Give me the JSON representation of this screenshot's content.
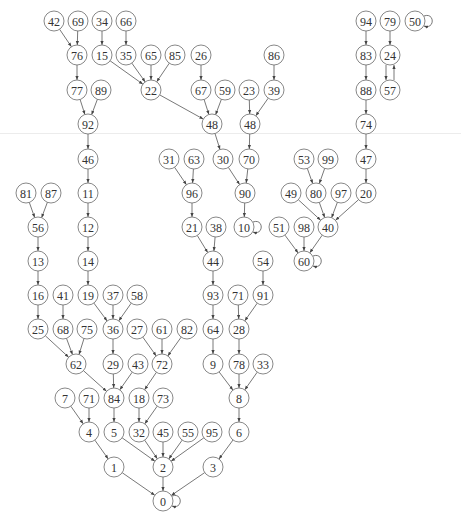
{
  "diagram": {
    "type": "directed-graph",
    "node_radius": 10,
    "colors": {
      "node_stroke": "#6a6a6a",
      "edge": "#555555",
      "label": "#333333",
      "divider": "#ececec"
    },
    "nodes": [
      {
        "id": "n42",
        "label": "42",
        "x": 54,
        "y": 21
      },
      {
        "id": "n69",
        "label": "69",
        "x": 78,
        "y": 21
      },
      {
        "id": "n34",
        "label": "34",
        "x": 102,
        "y": 21
      },
      {
        "id": "n66",
        "label": "66",
        "x": 126,
        "y": 21
      },
      {
        "id": "n94",
        "label": "94",
        "x": 366,
        "y": 21
      },
      {
        "id": "n79",
        "label": "79",
        "x": 390,
        "y": 21
      },
      {
        "id": "n50",
        "label": "50",
        "x": 415,
        "y": 21
      },
      {
        "id": "n76",
        "label": "76",
        "x": 77,
        "y": 55
      },
      {
        "id": "n15",
        "label": "15",
        "x": 102,
        "y": 55
      },
      {
        "id": "n35",
        "label": "35",
        "x": 126,
        "y": 55
      },
      {
        "id": "n65",
        "label": "65",
        "x": 151,
        "y": 55
      },
      {
        "id": "n85",
        "label": "85",
        "x": 175,
        "y": 55
      },
      {
        "id": "n26",
        "label": "26",
        "x": 201,
        "y": 55
      },
      {
        "id": "n86",
        "label": "86",
        "x": 274,
        "y": 55
      },
      {
        "id": "n83",
        "label": "83",
        "x": 366,
        "y": 55
      },
      {
        "id": "n24",
        "label": "24",
        "x": 390,
        "y": 55
      },
      {
        "id": "n77",
        "label": "77",
        "x": 77,
        "y": 90
      },
      {
        "id": "n89",
        "label": "89",
        "x": 101,
        "y": 90
      },
      {
        "id": "n22",
        "label": "22",
        "x": 151,
        "y": 90
      },
      {
        "id": "n67",
        "label": "67",
        "x": 201,
        "y": 90
      },
      {
        "id": "n59",
        "label": "59",
        "x": 225,
        "y": 90
      },
      {
        "id": "n23",
        "label": "23",
        "x": 249,
        "y": 90
      },
      {
        "id": "n39",
        "label": "39",
        "x": 274,
        "y": 90
      },
      {
        "id": "n88",
        "label": "88",
        "x": 366,
        "y": 90
      },
      {
        "id": "n57",
        "label": "57",
        "x": 390,
        "y": 90
      },
      {
        "id": "n92",
        "label": "92",
        "x": 88,
        "y": 124
      },
      {
        "id": "n48a",
        "label": "48",
        "x": 212,
        "y": 124
      },
      {
        "id": "n48b",
        "label": "48",
        "x": 250,
        "y": 124
      },
      {
        "id": "n74",
        "label": "74",
        "x": 366,
        "y": 124
      },
      {
        "id": "n46",
        "label": "46",
        "x": 88,
        "y": 159
      },
      {
        "id": "n31",
        "label": "31",
        "x": 169,
        "y": 159
      },
      {
        "id": "n63",
        "label": "63",
        "x": 194,
        "y": 159
      },
      {
        "id": "n30",
        "label": "30",
        "x": 223,
        "y": 159
      },
      {
        "id": "n70",
        "label": "70",
        "x": 249,
        "y": 159
      },
      {
        "id": "n53",
        "label": "53",
        "x": 304,
        "y": 159
      },
      {
        "id": "n99",
        "label": "99",
        "x": 328,
        "y": 159
      },
      {
        "id": "n47",
        "label": "47",
        "x": 366,
        "y": 159
      },
      {
        "id": "n81",
        "label": "81",
        "x": 26,
        "y": 193
      },
      {
        "id": "n87",
        "label": "87",
        "x": 51,
        "y": 193
      },
      {
        "id": "n11",
        "label": "11",
        "x": 88,
        "y": 193
      },
      {
        "id": "n96",
        "label": "96",
        "x": 192,
        "y": 193
      },
      {
        "id": "n90",
        "label": "90",
        "x": 245,
        "y": 193
      },
      {
        "id": "n49",
        "label": "49",
        "x": 291,
        "y": 193
      },
      {
        "id": "n80",
        "label": "80",
        "x": 316,
        "y": 193
      },
      {
        "id": "n97",
        "label": "97",
        "x": 341,
        "y": 193
      },
      {
        "id": "n20",
        "label": "20",
        "x": 366,
        "y": 193
      },
      {
        "id": "n56",
        "label": "56",
        "x": 38,
        "y": 227
      },
      {
        "id": "n12",
        "label": "12",
        "x": 88,
        "y": 227
      },
      {
        "id": "n21",
        "label": "21",
        "x": 192,
        "y": 227
      },
      {
        "id": "n38",
        "label": "38",
        "x": 216,
        "y": 227
      },
      {
        "id": "n10",
        "label": "10",
        "x": 244,
        "y": 227
      },
      {
        "id": "n51",
        "label": "51",
        "x": 279,
        "y": 227
      },
      {
        "id": "n98",
        "label": "98",
        "x": 304,
        "y": 227
      },
      {
        "id": "n40",
        "label": "40",
        "x": 328,
        "y": 227
      },
      {
        "id": "n13",
        "label": "13",
        "x": 38,
        "y": 261
      },
      {
        "id": "n14",
        "label": "14",
        "x": 88,
        "y": 261
      },
      {
        "id": "n44",
        "label": "44",
        "x": 213,
        "y": 261
      },
      {
        "id": "n54",
        "label": "54",
        "x": 263,
        "y": 261
      },
      {
        "id": "n60",
        "label": "60",
        "x": 304,
        "y": 261
      },
      {
        "id": "n16",
        "label": "16",
        "x": 38,
        "y": 295
      },
      {
        "id": "n41",
        "label": "41",
        "x": 63,
        "y": 295
      },
      {
        "id": "n19",
        "label": "19",
        "x": 88,
        "y": 295
      },
      {
        "id": "n37",
        "label": "37",
        "x": 113,
        "y": 295
      },
      {
        "id": "n58",
        "label": "58",
        "x": 137,
        "y": 295
      },
      {
        "id": "n93",
        "label": "93",
        "x": 213,
        "y": 295
      },
      {
        "id": "n71a",
        "label": "71",
        "x": 238,
        "y": 295
      },
      {
        "id": "n91",
        "label": "91",
        "x": 263,
        "y": 295
      },
      {
        "id": "n25",
        "label": "25",
        "x": 38,
        "y": 329
      },
      {
        "id": "n68",
        "label": "68",
        "x": 63,
        "y": 329
      },
      {
        "id": "n75",
        "label": "75",
        "x": 87,
        "y": 329
      },
      {
        "id": "n36",
        "label": "36",
        "x": 113,
        "y": 329
      },
      {
        "id": "n27",
        "label": "27",
        "x": 137,
        "y": 329
      },
      {
        "id": "n61",
        "label": "61",
        "x": 162,
        "y": 329
      },
      {
        "id": "n82",
        "label": "82",
        "x": 187,
        "y": 329
      },
      {
        "id": "n64",
        "label": "64",
        "x": 213,
        "y": 329
      },
      {
        "id": "n28",
        "label": "28",
        "x": 239,
        "y": 329
      },
      {
        "id": "n62",
        "label": "62",
        "x": 76,
        "y": 364
      },
      {
        "id": "n29",
        "label": "29",
        "x": 113,
        "y": 364
      },
      {
        "id": "n43",
        "label": "43",
        "x": 138,
        "y": 364
      },
      {
        "id": "n72",
        "label": "72",
        "x": 162,
        "y": 364
      },
      {
        "id": "n9",
        "label": "9",
        "x": 213,
        "y": 364
      },
      {
        "id": "n78",
        "label": "78",
        "x": 239,
        "y": 364
      },
      {
        "id": "n33",
        "label": "33",
        "x": 263,
        "y": 364
      },
      {
        "id": "n7",
        "label": "7",
        "x": 65,
        "y": 398
      },
      {
        "id": "n71b",
        "label": "71",
        "x": 89,
        "y": 398
      },
      {
        "id": "n84",
        "label": "84",
        "x": 114,
        "y": 398
      },
      {
        "id": "n18",
        "label": "18",
        "x": 139,
        "y": 398
      },
      {
        "id": "n73",
        "label": "73",
        "x": 163,
        "y": 398
      },
      {
        "id": "n8",
        "label": "8",
        "x": 239,
        "y": 398
      },
      {
        "id": "n4",
        "label": "4",
        "x": 89,
        "y": 432
      },
      {
        "id": "n5",
        "label": "5",
        "x": 114,
        "y": 432
      },
      {
        "id": "n32",
        "label": "32",
        "x": 139,
        "y": 432
      },
      {
        "id": "n45",
        "label": "45",
        "x": 163,
        "y": 432
      },
      {
        "id": "n55",
        "label": "55",
        "x": 188,
        "y": 432
      },
      {
        "id": "n95",
        "label": "95",
        "x": 212,
        "y": 432
      },
      {
        "id": "n6",
        "label": "6",
        "x": 239,
        "y": 432
      },
      {
        "id": "n1",
        "label": "1",
        "x": 114,
        "y": 467
      },
      {
        "id": "n2",
        "label": "2",
        "x": 163,
        "y": 467
      },
      {
        "id": "n3",
        "label": "3",
        "x": 213,
        "y": 467
      },
      {
        "id": "n0",
        "label": "0",
        "x": 163,
        "y": 501
      }
    ],
    "edges": [
      [
        "n42",
        "n76"
      ],
      [
        "n69",
        "n76"
      ],
      [
        "n34",
        "n15"
      ],
      [
        "n66",
        "n35"
      ],
      [
        "n94",
        "n83"
      ],
      [
        "n79",
        "n24"
      ],
      [
        "n50",
        "n50"
      ],
      [
        "n15",
        "n22"
      ],
      [
        "n35",
        "n22"
      ],
      [
        "n65",
        "n22"
      ],
      [
        "n85",
        "n22"
      ],
      [
        "n26",
        "n67"
      ],
      [
        "n86",
        "n39"
      ],
      [
        "n83",
        "n88"
      ],
      [
        "n24",
        "n57"
      ],
      [
        "n57",
        "n24"
      ],
      [
        "n76",
        "n77"
      ],
      [
        "n77",
        "n92"
      ],
      [
        "n89",
        "n92"
      ],
      [
        "n22",
        "n48a"
      ],
      [
        "n67",
        "n48a"
      ],
      [
        "n59",
        "n48a"
      ],
      [
        "n23",
        "n48b"
      ],
      [
        "n39",
        "n48b"
      ],
      [
        "n88",
        "n74"
      ],
      [
        "n92",
        "n46"
      ],
      [
        "n48a",
        "n30"
      ],
      [
        "n48b",
        "n70"
      ],
      [
        "n74",
        "n47"
      ],
      [
        "n46",
        "n11"
      ],
      [
        "n31",
        "n96"
      ],
      [
        "n63",
        "n96"
      ],
      [
        "n30",
        "n90"
      ],
      [
        "n70",
        "n90"
      ],
      [
        "n53",
        "n80"
      ],
      [
        "n99",
        "n80"
      ],
      [
        "n47",
        "n20"
      ],
      [
        "n81",
        "n56"
      ],
      [
        "n87",
        "n56"
      ],
      [
        "n11",
        "n12"
      ],
      [
        "n96",
        "n21"
      ],
      [
        "n90",
        "n10"
      ],
      [
        "n10",
        "n10"
      ],
      [
        "n49",
        "n40"
      ],
      [
        "n80",
        "n40"
      ],
      [
        "n97",
        "n40"
      ],
      [
        "n20",
        "n40"
      ],
      [
        "n56",
        "n13"
      ],
      [
        "n12",
        "n14"
      ],
      [
        "n21",
        "n44"
      ],
      [
        "n38",
        "n44"
      ],
      [
        "n51",
        "n60"
      ],
      [
        "n98",
        "n60"
      ],
      [
        "n40",
        "n60"
      ],
      [
        "n60",
        "n60"
      ],
      [
        "n13",
        "n16"
      ],
      [
        "n14",
        "n19"
      ],
      [
        "n44",
        "n93"
      ],
      [
        "n54",
        "n91"
      ],
      [
        "n16",
        "n25"
      ],
      [
        "n41",
        "n68"
      ],
      [
        "n19",
        "n36"
      ],
      [
        "n37",
        "n36"
      ],
      [
        "n58",
        "n36"
      ],
      [
        "n93",
        "n64"
      ],
      [
        "n71a",
        "n28"
      ],
      [
        "n91",
        "n28"
      ],
      [
        "n25",
        "n62"
      ],
      [
        "n68",
        "n62"
      ],
      [
        "n75",
        "n62"
      ],
      [
        "n36",
        "n29"
      ],
      [
        "n27",
        "n72"
      ],
      [
        "n61",
        "n72"
      ],
      [
        "n82",
        "n72"
      ],
      [
        "n64",
        "n9"
      ],
      [
        "n28",
        "n78"
      ],
      [
        "n62",
        "n84"
      ],
      [
        "n29",
        "n84"
      ],
      [
        "n43",
        "n84"
      ],
      [
        "n72",
        "n18"
      ],
      [
        "n9",
        "n8"
      ],
      [
        "n78",
        "n8"
      ],
      [
        "n33",
        "n8"
      ],
      [
        "n7",
        "n4"
      ],
      [
        "n71b",
        "n4"
      ],
      [
        "n84",
        "n5"
      ],
      [
        "n18",
        "n32"
      ],
      [
        "n73",
        "n32"
      ],
      [
        "n8",
        "n6"
      ],
      [
        "n4",
        "n1"
      ],
      [
        "n5",
        "n2"
      ],
      [
        "n32",
        "n2"
      ],
      [
        "n45",
        "n2"
      ],
      [
        "n55",
        "n2"
      ],
      [
        "n95",
        "n2"
      ],
      [
        "n6",
        "n3"
      ],
      [
        "n1",
        "n0"
      ],
      [
        "n2",
        "n0"
      ],
      [
        "n3",
        "n0"
      ],
      [
        "n0",
        "n0"
      ]
    ]
  }
}
